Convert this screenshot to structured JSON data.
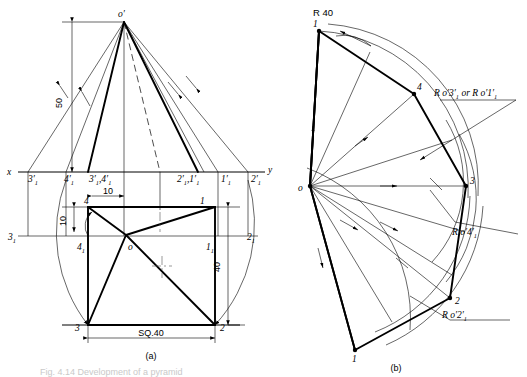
{
  "figure": {
    "title_caption_a": "(a)",
    "title_caption_b": "(b)",
    "footer_faint": "Fig. 4.14  Development of a pyramid"
  },
  "colors": {
    "ink": "#000000",
    "construction": "#555555",
    "faint": "#c9c9c9"
  },
  "view_a": {
    "name": "front-view-and-top-view",
    "axis_x_label": "x",
    "axis_y_label": "y",
    "apex_label": "o′",
    "center_label": "o",
    "dim_height": "50",
    "dim_small": "10",
    "dim_small2": "10",
    "dim_depth": "40",
    "dim_base": "SQ.40",
    "labels": [
      {
        "id": "l-3p1",
        "text": "3′",
        "sub": "1",
        "x": 28,
        "y": 182
      },
      {
        "id": "l-4p1",
        "text": "4′",
        "sub": "1",
        "x": 66,
        "y": 182
      },
      {
        "id": "l-3p4p1",
        "text": "3′ ,4′",
        "sub": "1",
        "x": 92,
        "y": 182
      },
      {
        "id": "l-2p1p1",
        "text": "2′ ,1′",
        "sub": "1",
        "x": 183,
        "y": 182
      },
      {
        "id": "l-1p1",
        "text": "1′",
        "sub": "1",
        "x": 222,
        "y": 182
      },
      {
        "id": "l-2p1",
        "text": "2′",
        "sub": "1",
        "x": 252,
        "y": 182
      },
      {
        "id": "l-4",
        "text": "4",
        "sub": "",
        "x": 86,
        "y": 200
      },
      {
        "id": "l-1",
        "text": "1",
        "sub": "",
        "x": 201,
        "y": 200
      },
      {
        "id": "l-3sub1",
        "text": "3",
        "sub": "1",
        "x": 9,
        "y": 240
      },
      {
        "id": "l-4sub1",
        "text": "4",
        "sub": "1",
        "x": 79,
        "y": 248
      },
      {
        "id": "l-1sub1",
        "text": "1",
        "sub": "1",
        "x": 208,
        "y": 248
      },
      {
        "id": "l-2sub1",
        "text": "2",
        "sub": "1",
        "x": 248,
        "y": 240
      },
      {
        "id": "l-3",
        "text": "3",
        "sub": "",
        "x": 76,
        "y": 331
      },
      {
        "id": "l-2",
        "text": "2",
        "sub": "",
        "x": 221,
        "y": 331
      }
    ]
  },
  "view_b": {
    "name": "development-of-surface",
    "center_label": "o",
    "radius_label": "R 40",
    "annotation_1": "R o′3′  or R o′1′",
    "annotation_1_sub": "1",
    "annotation_2": "R o′4′",
    "annotation_2_sub": "1",
    "annotation_3": "R o′2′",
    "annotation_3_sub": "1",
    "points": [
      {
        "id": "b-1-top",
        "label": "1",
        "x": 319,
        "y": 26
      },
      {
        "id": "b-4",
        "label": "4",
        "x": 419,
        "y": 93
      },
      {
        "id": "b-3",
        "label": "3",
        "x": 472,
        "y": 184
      },
      {
        "id": "b-2",
        "label": "2",
        "x": 455,
        "y": 302
      },
      {
        "id": "b-1-bot",
        "label": "1",
        "x": 355,
        "y": 350
      },
      {
        "id": "b-o",
        "label": "o",
        "x": 300,
        "y": 190
      }
    ]
  }
}
